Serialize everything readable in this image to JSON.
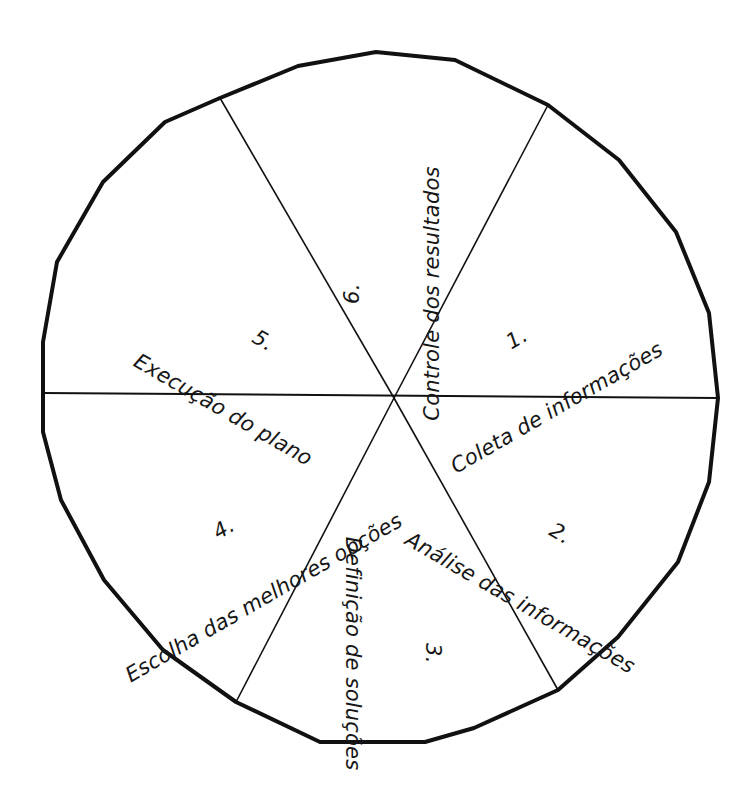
{
  "diagram": {
    "type": "pie-wheel",
    "title": "",
    "shape": "hand-drawn polygon circle",
    "center": {
      "x": 394,
      "y": 398
    },
    "segment_count": 6,
    "stroke_color": "#111111",
    "outline_stroke_width": 4,
    "divider_stroke_width": 1.6,
    "background_color": "#ffffff",
    "segments": [
      {
        "number": "1.",
        "label": "Coleta de informações",
        "position": "right-upper",
        "rotation_deg": -30,
        "center": {
          "x": 537,
          "y": 300
        }
      },
      {
        "number": "2.",
        "label": "Análise das informações",
        "position": "right-lower",
        "rotation_deg": 30,
        "center": {
          "x": 540,
          "y": 495
        }
      },
      {
        "number": "3.",
        "label": "Definição de soluções",
        "position": "bottom",
        "rotation_deg": 90,
        "center": {
          "x": 392,
          "y": 580
        }
      },
      {
        "number": "4.",
        "label": "Escolha das melhores opções",
        "position": "left-lower",
        "rotation_deg": -30,
        "center": {
          "x": 244,
          "y": 490
        }
      },
      {
        "number": "5.",
        "label": "Execução do plano",
        "position": "left-upper",
        "rotation_deg": 30,
        "center": {
          "x": 243,
          "y": 302
        }
      },
      {
        "number": "6.",
        "label": "Controle dos resultados",
        "position": "top",
        "rotation_deg": 270,
        "center": {
          "x": 392,
          "y": 220
        }
      }
    ]
  }
}
